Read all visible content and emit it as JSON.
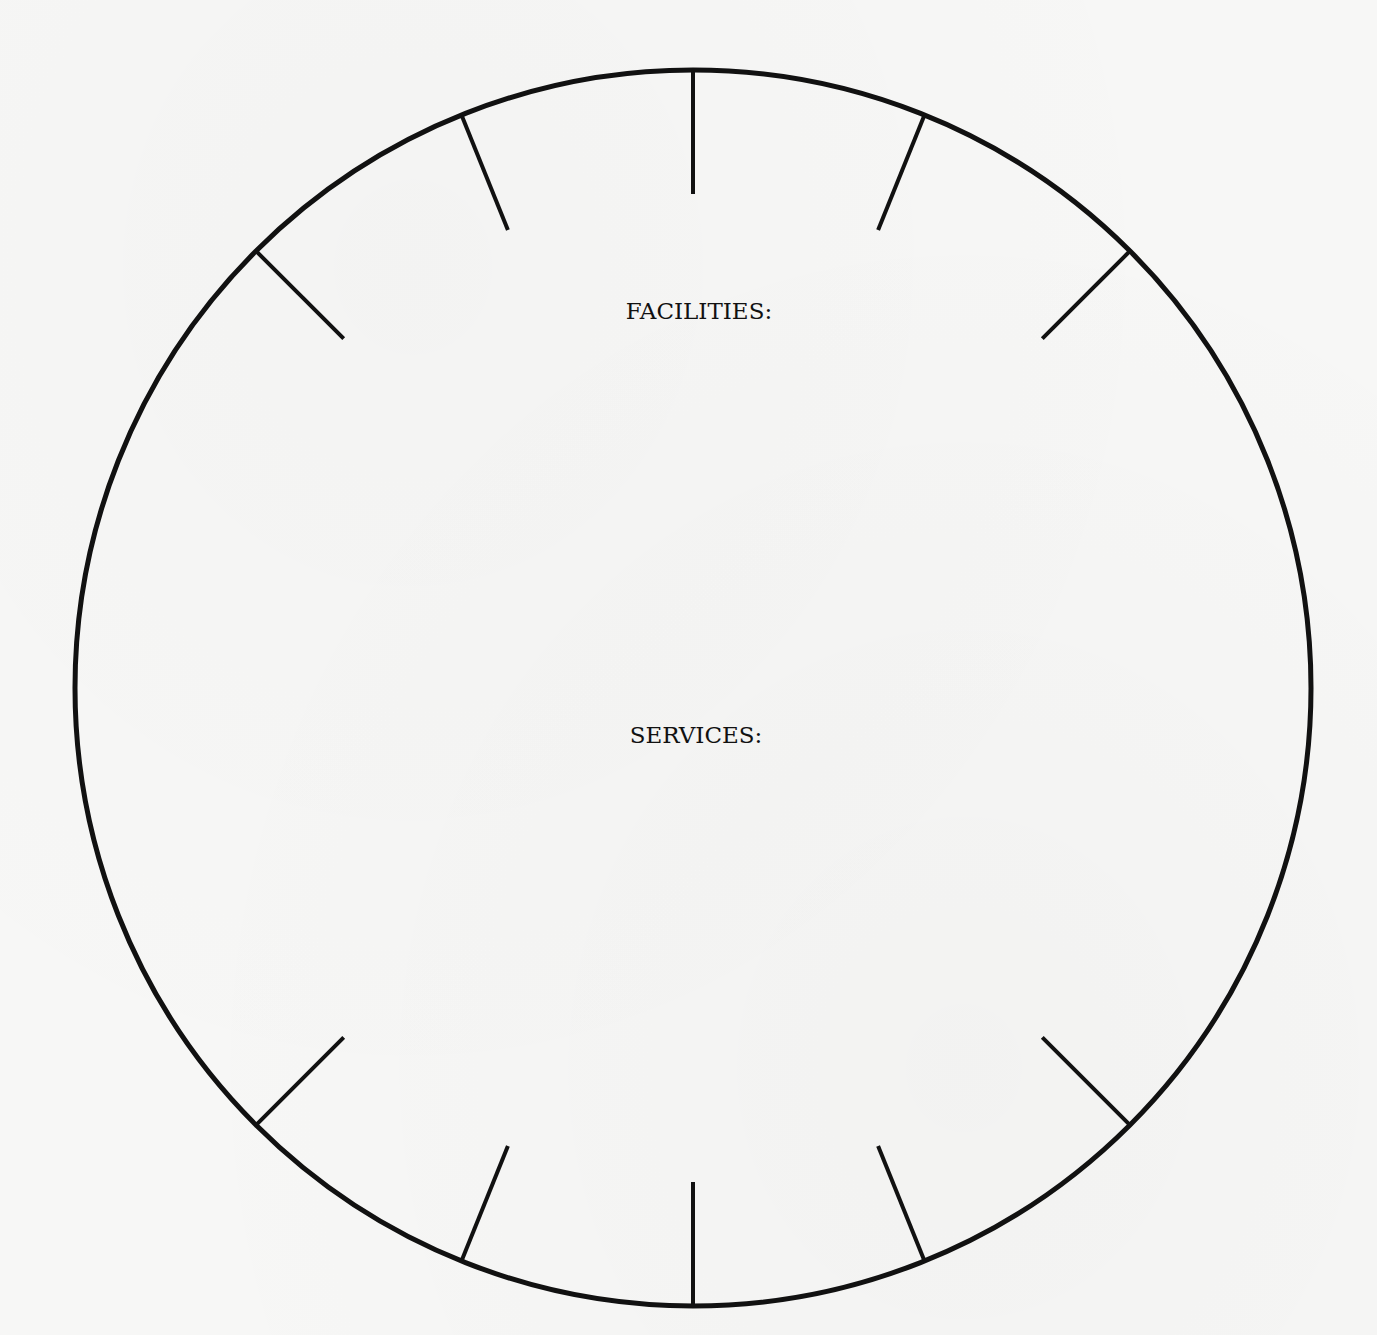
{
  "diagram": {
    "type": "circular worksheet wheel",
    "labels": {
      "facilities": "FACILITIES:",
      "services": "SERVICES:"
    },
    "circle": {
      "cx": 693,
      "cy": 688,
      "r": 618,
      "stroke": "#111111",
      "stroke_width": 5
    },
    "tick_marks": {
      "count": 10,
      "angles_deg_from_top": [
        -45,
        -22,
        0,
        22,
        45,
        135,
        158,
        180,
        202,
        225
      ],
      "length": 124,
      "stroke_width": 4,
      "color": "#111111"
    },
    "colors": {
      "paper": "#f7f7f6",
      "ink": "#111111"
    }
  }
}
